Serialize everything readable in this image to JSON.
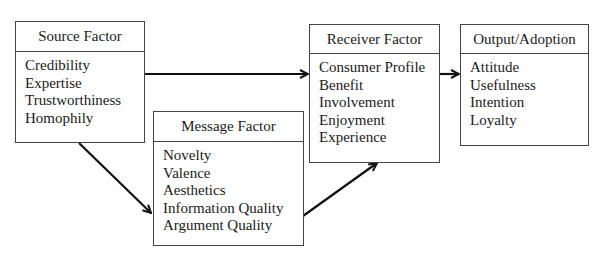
{
  "diagram": {
    "nodes": [
      {
        "id": "source",
        "title": "Source Factor",
        "items": [
          "Credibility",
          "Expertise",
          "Trustworthiness",
          "Homophily"
        ]
      },
      {
        "id": "message",
        "title": "Message Factor",
        "items": [
          "Novelty",
          "Valence",
          "Aesthetics",
          "Information Quality",
          "Argument Quality"
        ]
      },
      {
        "id": "receiver",
        "title": "Receiver Factor",
        "items": [
          "Consumer Profile",
          "Benefit",
          "Involvement",
          "Enjoyment",
          "Experience"
        ]
      },
      {
        "id": "output",
        "title": "Output/Adoption",
        "items": [
          "Attitude",
          "Usefulness",
          "Intention",
          "Loyalty"
        ]
      }
    ],
    "edges": [
      {
        "from": "source",
        "to": "receiver"
      },
      {
        "from": "source",
        "to": "message"
      },
      {
        "from": "message",
        "to": "receiver"
      },
      {
        "from": "receiver",
        "to": "output"
      }
    ]
  }
}
